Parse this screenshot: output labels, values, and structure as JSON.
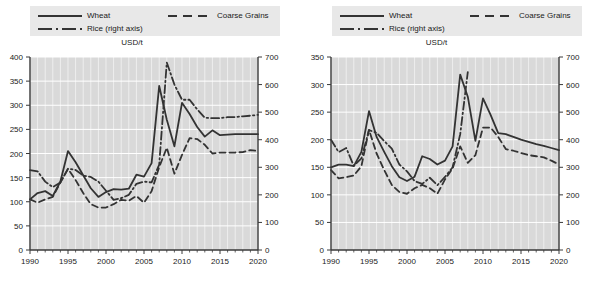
{
  "figure": {
    "panels": [
      {
        "id": "left",
        "title": "USD/t",
        "legend": {
          "wheat": "Wheat",
          "coarse_grains": "Coarse Grains",
          "rice": "Rice (right axis)"
        },
        "axes": {
          "x_label_min": "1990",
          "x_label_max": "2020",
          "x_ticks": [
            "1990",
            "1995",
            "2000",
            "2005",
            "2010",
            "2015",
            "2020"
          ],
          "y_left_ticks": [
            "0",
            "50",
            "100",
            "150",
            "200",
            "250",
            "300",
            "350",
            "400"
          ],
          "y_right_ticks": [
            "0",
            "100",
            "200",
            "300",
            "400",
            "500",
            "600",
            "700"
          ]
        }
      },
      {
        "id": "right",
        "title": "USD/t",
        "legend": {
          "wheat": "Wheat",
          "coarse_grains": "Coarse Grains",
          "rice": "Rice (right axis)"
        },
        "axes": {
          "x_label_min": "1990",
          "x_label_max": "2020",
          "x_ticks": [
            "1990",
            "1995",
            "2000",
            "2005",
            "2010",
            "2015",
            "2020"
          ],
          "y_left_ticks": [
            "0",
            "50",
            "100",
            "150",
            "200",
            "250",
            "300",
            "350"
          ],
          "y_right_ticks": [
            "0",
            "100",
            "200",
            "300",
            "400",
            "500",
            "600",
            "700"
          ]
        }
      }
    ]
  },
  "chart_data": [
    {
      "type": "line",
      "panel": "left",
      "title": "USD/t",
      "xlabel": "",
      "ylabel": "USD/t",
      "xlim": [
        1990,
        2020
      ],
      "ylim": [
        0,
        400
      ],
      "ylim_right": [
        0,
        700
      ],
      "grid": true,
      "legend_position": "top",
      "x": [
        1990,
        1991,
        1992,
        1993,
        1994,
        1995,
        1996,
        1997,
        1998,
        1999,
        2000,
        2001,
        2002,
        2003,
        2004,
        2005,
        2006,
        2007,
        2008,
        2009,
        2010,
        2011,
        2012,
        2013,
        2014,
        2015,
        2016,
        2017,
        2018,
        2019,
        2020
      ],
      "series": [
        {
          "name": "Wheat",
          "axis": "left",
          "style": "solid",
          "values": [
            105,
            118,
            122,
            112,
            142,
            205,
            182,
            155,
            128,
            110,
            120,
            126,
            125,
            127,
            156,
            152,
            180,
            340,
            270,
            215,
            305,
            282,
            255,
            235,
            248,
            238,
            239,
            240,
            240,
            240,
            240
          ]
        },
        {
          "name": "Coarse Grains",
          "axis": "left",
          "style": "dashed",
          "values": [
            105,
            98,
            105,
            110,
            140,
            168,
            145,
            118,
            95,
            88,
            88,
            95,
            104,
            102,
            112,
            98,
            122,
            172,
            212,
            158,
            197,
            232,
            230,
            218,
            200,
            202,
            202,
            202,
            203,
            207,
            205
          ]
        },
        {
          "name": "Rice (right axis)",
          "axis": "right",
          "style": "dashdot",
          "values": [
            290,
            285,
            248,
            228,
            245,
            295,
            290,
            270,
            265,
            248,
            215,
            182,
            188,
            200,
            240,
            248,
            245,
            310,
            680,
            600,
            545,
            545,
            510,
            480,
            478,
            478,
            482,
            482,
            485,
            487,
            490
          ]
        }
      ]
    },
    {
      "type": "line",
      "panel": "right",
      "title": "USD/t",
      "xlabel": "",
      "ylabel": "USD/t",
      "xlim": [
        1990,
        2020
      ],
      "ylim": [
        0,
        350
      ],
      "ylim_right": [
        0,
        700
      ],
      "grid": true,
      "legend_position": "top",
      "x": [
        1990,
        1991,
        1992,
        1993,
        1994,
        1995,
        1996,
        1997,
        1998,
        1999,
        2000,
        2001,
        2002,
        2003,
        2004,
        2005,
        2006,
        2007,
        2008,
        2009,
        2010,
        2011,
        2012,
        2013,
        2014,
        2015,
        2016,
        2017,
        2018,
        2019,
        2020
      ],
      "series": [
        {
          "name": "Wheat",
          "axis": "left",
          "style": "solid",
          "values": [
            150,
            155,
            155,
            152,
            178,
            252,
            205,
            178,
            152,
            132,
            125,
            133,
            170,
            165,
            155,
            162,
            188,
            318,
            278,
            198,
            275,
            245,
            212,
            210,
            205,
            200,
            196,
            192,
            189,
            185,
            181
          ]
        },
        {
          "name": "Coarse Grains",
          "axis": "left",
          "style": "dashed",
          "values": [
            145,
            130,
            132,
            135,
            152,
            218,
            175,
            145,
            118,
            105,
            102,
            112,
            118,
            112,
            102,
            128,
            148,
            188,
            158,
            172,
            222,
            222,
            205,
            183,
            180,
            176,
            172,
            170,
            168,
            162,
            155
          ]
        },
        {
          "name": "Rice (right axis)",
          "axis": "right",
          "style": "dashdot",
          "values": [
            400,
            355,
            370,
            305,
            332,
            435,
            425,
            395,
            368,
            310,
            285,
            250,
            240,
            262,
            235,
            265,
            300,
            420,
            645,
            null,
            null,
            null,
            null,
            null,
            null,
            null,
            null,
            null,
            null,
            null,
            null
          ]
        }
      ]
    }
  ]
}
